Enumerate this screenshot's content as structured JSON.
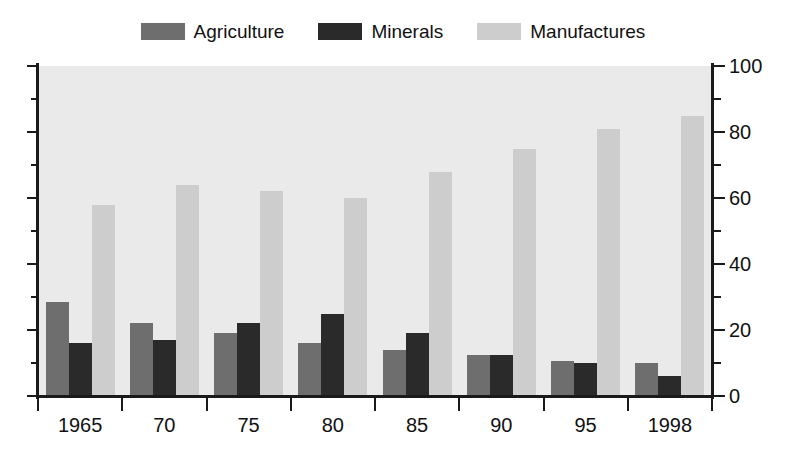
{
  "chart_data": {
    "type": "bar",
    "title": "",
    "xlabel": "",
    "ylabel": "",
    "ylim": [
      0,
      100
    ],
    "ytick_values": [
      0,
      20,
      40,
      60,
      80,
      100
    ],
    "ytick_labels": [
      "0",
      "20",
      "40",
      "60",
      "80",
      "100"
    ],
    "yminor_values": [
      10,
      30,
      50,
      70,
      90
    ],
    "y_axis_position": "right",
    "grid": false,
    "legend_position": "top-center",
    "categories": [
      "1965",
      "70",
      "75",
      "80",
      "85",
      "90",
      "95",
      "1998"
    ],
    "series": [
      {
        "name": "Agriculture",
        "color": "#6e6e6e",
        "values": [
          28.5,
          22,
          19,
          16,
          14,
          12.5,
          10.5,
          10
        ]
      },
      {
        "name": "Minerals",
        "color": "#2a2a2a",
        "values": [
          16,
          17,
          22,
          25,
          19,
          12.5,
          10,
          6
        ]
      },
      {
        "name": "Manufactures",
        "color": "#cdcdcd",
        "values": [
          58,
          64,
          62,
          60,
          68,
          75,
          81,
          85
        ]
      }
    ],
    "plot_background": "#eaeaea",
    "axis_color": "#1a1a1a"
  },
  "legend": {
    "items": [
      {
        "label": "Agriculture",
        "color": "#6e6e6e"
      },
      {
        "label": "Minerals",
        "color": "#2a2a2a"
      },
      {
        "label": "Manufactures",
        "color": "#cdcdcd"
      }
    ]
  }
}
